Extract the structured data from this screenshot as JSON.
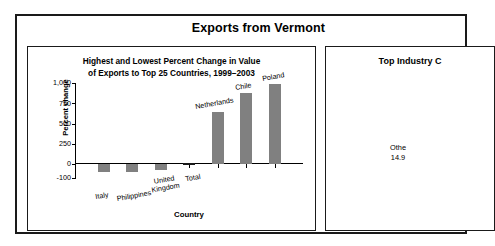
{
  "banner": {
    "title": "Exports from Vermont"
  },
  "chart_panel": {
    "title_line1": "Highest and Lowest Percent Change in Value",
    "title_line2": "of Exports to Top 25 Countries, 1999–2003"
  },
  "industry_panel": {
    "title": "Top Industry C",
    "slice_label_line1": "Othe",
    "slice_label_line2": "14.9"
  },
  "chart_data": {
    "type": "bar",
    "title": "Highest and Lowest Percent Change in Value of Exports to Top 25 Countries, 1999–2003",
    "xlabel": "Country",
    "ylabel": "Percent change",
    "categories": [
      "Italy",
      "Philippines",
      "United Kingdom",
      "Total",
      "Netherlands",
      "Chile",
      "Poland"
    ],
    "values": [
      -55,
      -60,
      -45,
      10,
      640,
      880,
      990
    ],
    "bar_colors": [
      "#808080",
      "#808080",
      "#808080",
      "#1a1a1a",
      "#808080",
      "#808080",
      "#808080"
    ],
    "value_labels": [
      "",
      "",
      "",
      "",
      "Netherlands",
      "Chile",
      "Poland"
    ],
    "ytick_labels": [
      "1,000",
      "750",
      "500",
      "250",
      "0",
      "-100"
    ],
    "ytick_values": [
      1000,
      750,
      500,
      250,
      0,
      -100
    ],
    "ylim": [
      -100,
      1000
    ],
    "grid": false,
    "legend": "none"
  }
}
